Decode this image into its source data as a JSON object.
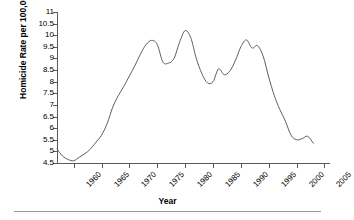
{
  "chart_data": {
    "type": "line",
    "title": "",
    "xlabel": "Year",
    "ylabel": "Homicide Rate per 100,000",
    "xlim": [
      1957,
      2006
    ],
    "ylim": [
      4.5,
      11
    ],
    "grid": false,
    "legend": false,
    "y_ticks": [
      "4.5",
      "5",
      "5.5",
      "6",
      "6.5",
      "7",
      "7.5",
      "8",
      "8.5",
      "9",
      "9.5",
      "10",
      "10.5",
      "11"
    ],
    "y_tick_values": [
      4.5,
      5,
      5.5,
      6,
      6.5,
      7,
      7.5,
      8,
      8.5,
      9,
      9.5,
      10,
      10.5,
      11
    ],
    "x_ticks": [
      "1960",
      "1965",
      "1970",
      "1975",
      "1980",
      "1985",
      "1990",
      "1995",
      "2000",
      "2005"
    ],
    "x_tick_values": [
      1960,
      1965,
      1970,
      1975,
      1980,
      1985,
      1990,
      1995,
      2000,
      2005
    ],
    "series": [
      {
        "name": "Homicide Rate per 100,000",
        "color": "#4d4d4d",
        "x": [
          1957,
          1958,
          1959,
          1960,
          1961,
          1962,
          1963,
          1964,
          1965,
          1966,
          1967,
          1968,
          1969,
          1970,
          1971,
          1972,
          1973,
          1974,
          1975,
          1976,
          1977,
          1978,
          1979,
          1980,
          1981,
          1982,
          1983,
          1984,
          1985,
          1986,
          1987,
          1988,
          1989,
          1990,
          1991,
          1992,
          1993,
          1994,
          1995,
          1996,
          1997,
          1998,
          1999,
          2000,
          2001,
          2002,
          2003
        ],
        "values": [
          5.1,
          4.8,
          4.65,
          4.6,
          4.75,
          4.9,
          5.1,
          5.4,
          5.7,
          6.2,
          6.9,
          7.4,
          7.8,
          8.25,
          8.7,
          9.2,
          9.6,
          9.78,
          9.6,
          8.85,
          8.8,
          9.0,
          9.7,
          10.2,
          9.9,
          9.0,
          8.35,
          7.95,
          8.0,
          8.55,
          8.3,
          8.45,
          8.9,
          9.5,
          9.8,
          9.45,
          9.55,
          9.1,
          8.2,
          7.4,
          6.8,
          6.3,
          5.7,
          5.5,
          5.55,
          5.65,
          5.35
        ]
      }
    ]
  },
  "axes": {
    "y_title": "Homicide Rate per 100,000",
    "x_title": "Year"
  }
}
